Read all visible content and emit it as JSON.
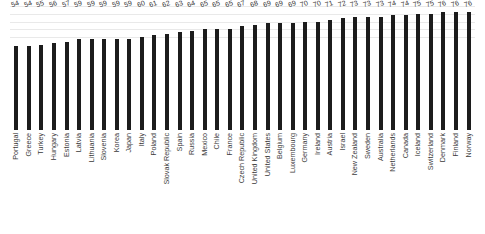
{
  "chart_data": {
    "type": "bar",
    "title": "",
    "subtitle": "",
    "xlabel": "",
    "ylabel": "",
    "ylim": [
      0,
      80
    ],
    "grid": true,
    "legend": "none",
    "orientation": "vertical",
    "bar_color": "#1c1c1c",
    "gridline_color": "#e9e9e9",
    "background_color": "#ffffff",
    "value_label_color": "#333333",
    "category_label_color": "#3a3a3a",
    "value_labels_shown": true,
    "axis_lines_shown": false,
    "tick_labels": [],
    "categories": [
      "Portugal",
      "Greece",
      "Turkey",
      "Hungary",
      "Estonia",
      "Latvia",
      "Lithuania",
      "Slovenia",
      "Korea",
      "Japan",
      "Italy",
      "Poland",
      "Slovak Republic",
      "Spain",
      "Russia",
      "Mexico",
      "Chile",
      "France",
      "Czech Republic",
      "United Kingdom",
      "United States",
      "Belgium",
      "Luxembourg",
      "Germany",
      "Ireland",
      "Austria",
      "Israel",
      "New Zealand",
      "Sweden",
      "Australia",
      "Netherlands",
      "Canada",
      "Iceland",
      "Switzerland",
      "Denmark",
      "Finland",
      "Norway"
    ],
    "values": [
      54,
      54,
      55,
      56,
      57,
      59,
      59,
      59,
      59,
      59,
      60,
      61,
      62,
      63,
      64,
      65,
      65,
      65,
      67,
      68,
      69,
      69,
      69,
      70,
      70,
      71,
      72,
      73,
      73,
      73,
      74,
      74,
      75,
      75,
      76,
      76,
      76
    ],
    "gridline_values": [
      60,
      65,
      70,
      75,
      80
    ]
  }
}
